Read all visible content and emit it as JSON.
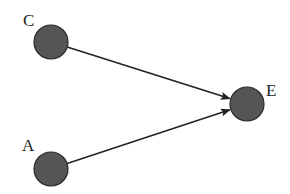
{
  "diagram": {
    "type": "directed-graph",
    "colors": {
      "node_fill": "#555555",
      "node_stroke": "#2a2a2a",
      "edge": "#222222",
      "label": "#222222",
      "background": "#ffffff"
    },
    "nodes": [
      {
        "id": "C",
        "label": "C",
        "cx": 51,
        "cy": 42,
        "r": 17,
        "label_x": 23,
        "label_y": 26
      },
      {
        "id": "E",
        "label": "E",
        "cx": 247,
        "cy": 104,
        "r": 17,
        "label_x": 266,
        "label_y": 96
      },
      {
        "id": "A",
        "label": "A",
        "cx": 51,
        "cy": 169,
        "r": 17,
        "label_x": 22,
        "label_y": 151
      }
    ],
    "edges": [
      {
        "from": "C",
        "to": "E"
      },
      {
        "from": "A",
        "to": "E"
      }
    ]
  }
}
